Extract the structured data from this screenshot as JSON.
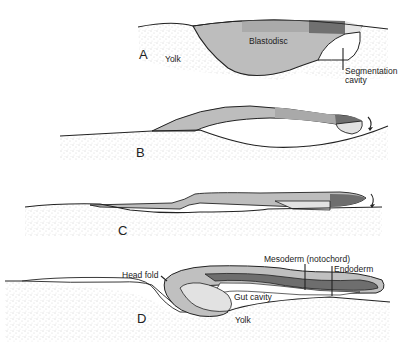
{
  "diagram": {
    "type": "embryo-development-stages",
    "colors": {
      "yolk_stipple": "#b8b8b8",
      "light_gray": "#bdbdbd",
      "mid_gray": "#a8a8a8",
      "dark_gray": "#6e6e6e",
      "pale": "#e2e2e2",
      "outline": "#222222",
      "background": "#ffffff"
    },
    "stages": [
      {
        "id": "A",
        "label": "A",
        "annotations": {
          "blastodisc": "Blastodisc",
          "yolk": "Yolk",
          "segmentation_cavity_line1": "Segmentation",
          "segmentation_cavity_line2": "cavity"
        }
      },
      {
        "id": "B",
        "label": "B",
        "annotations": {}
      },
      {
        "id": "C",
        "label": "C",
        "annotations": {}
      },
      {
        "id": "D",
        "label": "D",
        "annotations": {
          "head_fold": "Head fold",
          "mesoderm": "Mesoderm (notochord)",
          "endoderm": "Endoderm",
          "gut_cavity": "Gut cavity",
          "yolk": "Yolk"
        }
      }
    ]
  }
}
